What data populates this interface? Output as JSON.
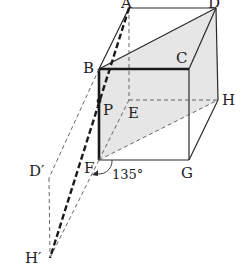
{
  "figure": {
    "type": "3d-cuboid-unfolding-diagram",
    "colors": {
      "line": "#2a2a2a",
      "hidden_line": "#555555",
      "shade": "#e4e4e4",
      "background": "#ffffff"
    },
    "labels": {
      "A": "A",
      "D": "D",
      "B": "B",
      "C": "C",
      "P": "P",
      "E": "E",
      "H": "H",
      "F": "F",
      "G": "G",
      "D_prime": "D′",
      "H_prime": "H′",
      "angle": "135°"
    },
    "vertices": {
      "A": [
        129,
        8
      ],
      "D": [
        216,
        8
      ],
      "B": [
        99,
        69
      ],
      "C": [
        189,
        69
      ],
      "E": [
        129,
        100
      ],
      "H": [
        218,
        100
      ],
      "F": [
        99,
        160
      ],
      "G": [
        189,
        160
      ],
      "P": [
        99,
        101
      ],
      "D_prime": [
        49,
        178
      ],
      "H_prime": [
        50,
        258
      ]
    }
  }
}
